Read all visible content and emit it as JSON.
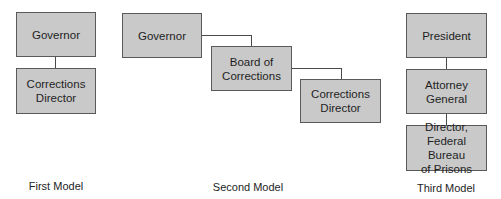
{
  "diagram": {
    "type": "organizational-chart",
    "colors": {
      "box_fill": "#c9c9c9",
      "box_border": "#5a5a5a",
      "line": "#4a4a4a",
      "text": "#1e1e1e"
    },
    "models": [
      {
        "caption": "First Model",
        "nodes": [
          {
            "id": "governor",
            "label": "Governor"
          },
          {
            "id": "corrections-director",
            "label": "Corrections Director",
            "lines": [
              "Corrections",
              "Director"
            ]
          }
        ],
        "edges": [
          [
            "governor",
            "corrections-director"
          ]
        ]
      },
      {
        "caption": "Second Model",
        "nodes": [
          {
            "id": "governor",
            "label": "Governor"
          },
          {
            "id": "board-of-corrections",
            "label": "Board of Corrections",
            "lines": [
              "Board of",
              "Corrections"
            ]
          },
          {
            "id": "corrections-director",
            "label": "Corrections Director",
            "lines": [
              "Corrections",
              "Director"
            ]
          }
        ],
        "edges": [
          [
            "governor",
            "board-of-corrections"
          ],
          [
            "board-of-corrections",
            "corrections-director"
          ]
        ]
      },
      {
        "caption": "Third Model",
        "nodes": [
          {
            "id": "president",
            "label": "President"
          },
          {
            "id": "attorney-general",
            "label": "Attorney General",
            "lines": [
              "Attorney",
              "General"
            ]
          },
          {
            "id": "director-bop",
            "label": "Director, Federal Bureau of Prisons",
            "lines": [
              "Director,",
              "Federal Bureau",
              "of Prisons"
            ]
          }
        ],
        "edges": [
          [
            "president",
            "attorney-general"
          ],
          [
            "attorney-general",
            "director-bop"
          ]
        ]
      }
    ]
  }
}
